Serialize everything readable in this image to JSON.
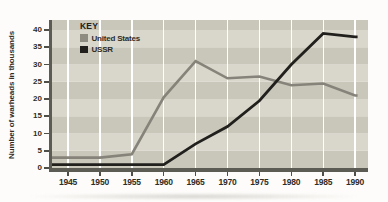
{
  "chart": {
    "y_axis_title": "Number of warheads in thousands",
    "key": {
      "title": "KEY",
      "items": [
        {
          "label": "United States",
          "color": "#8e8b81"
        },
        {
          "label": "USSR",
          "color": "#21201d"
        }
      ]
    },
    "colors": {
      "background": "#fdfcfa",
      "band_dark": "#c9c6ba",
      "band_light": "#d9d6cb",
      "gridline": "#ffffff",
      "axis": "#5d5c54",
      "text": "#2e2d28",
      "us_line": "#86837a",
      "ussr_line": "#21201d"
    }
  },
  "chart_data": {
    "type": "line",
    "title": "",
    "xlabel": "",
    "ylabel": "Number of warheads in thousands",
    "x": [
      1945,
      1950,
      1955,
      1960,
      1965,
      1970,
      1975,
      1980,
      1985,
      1990
    ],
    "series": [
      {
        "name": "United States",
        "color": "#86837a",
        "values": [
          3,
          3,
          4,
          20.5,
          31,
          26,
          26.5,
          24,
          24.5,
          21
        ]
      },
      {
        "name": "USSR",
        "color": "#21201d",
        "values": [
          1,
          1,
          1,
          1,
          7,
          12,
          19.5,
          30,
          39,
          38
        ]
      }
    ],
    "ylim": [
      0,
      43
    ],
    "yticks": [
      0,
      5,
      10,
      15,
      20,
      25,
      30,
      35,
      40
    ],
    "grid": "vertical white gridlines at each 5-year tick",
    "plot_background": "alternating horizontal bands every 5 units",
    "legend_position": "top-left inside plot"
  }
}
